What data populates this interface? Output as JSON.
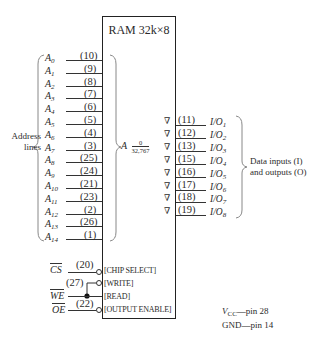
{
  "chip": {
    "title": "RAM 32k×8"
  },
  "address": {
    "group_label_1": "Address",
    "group_label_2": "lines",
    "range_prefix": "A",
    "range_top": "0",
    "range_bottom": "32,767",
    "lines": [
      {
        "name": "A",
        "sub": "0",
        "pin": "(10)"
      },
      {
        "name": "A",
        "sub": "1",
        "pin": "(9)"
      },
      {
        "name": "A",
        "sub": "2",
        "pin": "(8)"
      },
      {
        "name": "A",
        "sub": "3",
        "pin": "(7)"
      },
      {
        "name": "A",
        "sub": "4",
        "pin": "(6)"
      },
      {
        "name": "A",
        "sub": "5",
        "pin": "(5)"
      },
      {
        "name": "A",
        "sub": "6",
        "pin": "(4)"
      },
      {
        "name": "A",
        "sub": "7",
        "pin": "(3)"
      },
      {
        "name": "A",
        "sub": "8",
        "pin": "(25)"
      },
      {
        "name": "A",
        "sub": "9",
        "pin": "(24)"
      },
      {
        "name": "A",
        "sub": "10",
        "pin": "(21)"
      },
      {
        "name": "A",
        "sub": "11",
        "pin": "(23)"
      },
      {
        "name": "A",
        "sub": "12",
        "pin": "(2)"
      },
      {
        "name": "A",
        "sub": "13",
        "pin": "(26)"
      },
      {
        "name": "A",
        "sub": "14",
        "pin": "(1)"
      }
    ]
  },
  "data_io": {
    "group_label_1": "Data inputs (I)",
    "group_label_2": "and outputs (O)",
    "buffer_symbol": "∇",
    "lines": [
      {
        "name": "I/O",
        "sub": "1",
        "pin": "(11)"
      },
      {
        "name": "I/O",
        "sub": "2",
        "pin": "(12)"
      },
      {
        "name": "I/O",
        "sub": "3",
        "pin": "(13)"
      },
      {
        "name": "I/O",
        "sub": "4",
        "pin": "(15)"
      },
      {
        "name": "I/O",
        "sub": "5",
        "pin": "(16)"
      },
      {
        "name": "I/O",
        "sub": "6",
        "pin": "(17)"
      },
      {
        "name": "I/O",
        "sub": "7",
        "pin": "(18)"
      },
      {
        "name": "I/O",
        "sub": "8",
        "pin": "(19)"
      }
    ]
  },
  "control": {
    "cs": {
      "signal": "CS",
      "pin": "(20)",
      "label": "[CHIP SELECT]"
    },
    "write": {
      "pin": "(27)",
      "label": "[WRITE]"
    },
    "we": {
      "signal": "WE",
      "label": "[READ]"
    },
    "oe": {
      "signal": "OE",
      "pin": "(22)",
      "label": "[OUTPUT ENABLE]"
    }
  },
  "power": {
    "vcc_symbol": "V",
    "vcc_sub": "CC",
    "vcc_text": "—pin 28",
    "gnd_text": "GND—pin 14"
  }
}
